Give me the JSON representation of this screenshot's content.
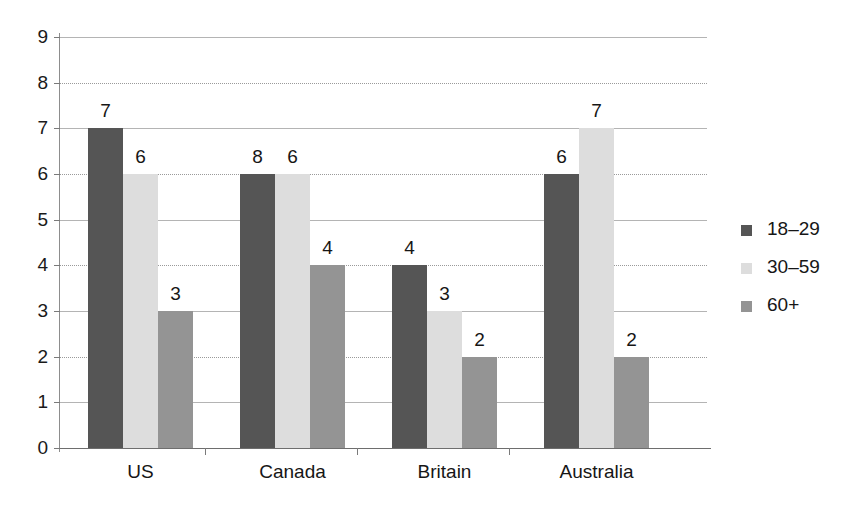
{
  "chart_data": {
    "type": "bar",
    "title": "",
    "subtitle": "",
    "xlabel": "",
    "ylabel": "",
    "categories": [
      "US",
      "Canada",
      "Britain",
      "Australia"
    ],
    "series": [
      {
        "name": "18–29",
        "color": "#555555",
        "values": [
          7,
          6,
          4,
          6
        ]
      },
      {
        "name": "30–59",
        "color": "#dddddd",
        "values": [
          6,
          6,
          3,
          7
        ]
      },
      {
        "name": "60+",
        "color": "#949494",
        "values": [
          3,
          4,
          2,
          2
        ]
      }
    ],
    "ylim": [
      0,
      9
    ],
    "y_ticks": [
      0,
      1,
      2,
      3,
      4,
      5,
      6,
      7,
      8,
      9
    ],
    "y_tick_labels": [
      "0",
      "1",
      "2",
      "3",
      "4",
      "5",
      "6",
      "7",
      "8",
      "9"
    ],
    "grid": true,
    "grid_axis": "y",
    "data_labels": true,
    "legend_position": "right",
    "legend_entries": [
      "18–29",
      "30–59",
      "60+"
    ],
    "bar_value_labels": [
      [
        "7",
        "6",
        "3"
      ],
      [
        "8",
        "6",
        "4"
      ],
      [
        "4",
        "3",
        "2"
      ],
      [
        "6",
        "7",
        "2"
      ]
    ]
  }
}
